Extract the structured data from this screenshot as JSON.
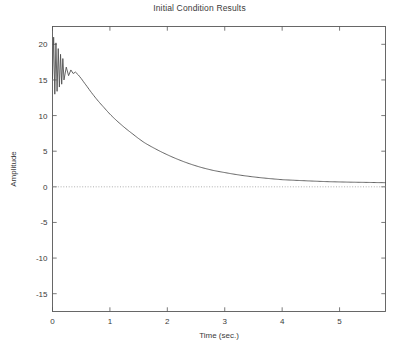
{
  "figure": {
    "title": "Initial Condition Results",
    "background": "#ffffff",
    "curve_color": "#4a4a4a",
    "axis_color": "#585858",
    "zero_line_color": "#9a9a9a"
  },
  "axes": {
    "x_title": "Time (sec.)",
    "y_title": "Amplitude",
    "x_ticks": [
      "0",
      "1",
      "2",
      "3",
      "4",
      "5"
    ],
    "y_ticks": [
      "20",
      "15",
      "10",
      "5",
      "0",
      "-5",
      "-10",
      "-15"
    ]
  },
  "chart_data": {
    "type": "line",
    "title": "Initial Condition Results",
    "xlabel": "Time (sec.)",
    "ylabel": "Amplitude",
    "xlim": [
      0,
      5.8
    ],
    "ylim": [
      -17.5,
      22.5
    ],
    "xticks": [
      0,
      1,
      2,
      3,
      4,
      5
    ],
    "yticks": [
      20,
      15,
      10,
      5,
      0,
      -5,
      -10,
      -15
    ],
    "grid": false,
    "legend": null,
    "annotations": [
      {
        "type": "hline",
        "y": 0,
        "style": "dotted",
        "label": "zero reference"
      }
    ],
    "series": [
      {
        "name": "initial condition response",
        "description": "Fast damped oscillation near t=0 decaying into a smooth exponential settling just above zero",
        "x": [
          0.0,
          0.02,
          0.04,
          0.06,
          0.08,
          0.1,
          0.12,
          0.14,
          0.16,
          0.18,
          0.2,
          0.24,
          0.28,
          0.32,
          0.36,
          0.4,
          0.45,
          0.5,
          0.6,
          0.7,
          0.8,
          0.9,
          1.0,
          1.2,
          1.4,
          1.6,
          1.8,
          2.0,
          2.2,
          2.4,
          2.6,
          2.8,
          3.0,
          3.3,
          3.6,
          4.0,
          4.4,
          4.8,
          5.2,
          5.8
        ],
        "y": [
          15.2,
          21.0,
          13.0,
          20.2,
          13.4,
          19.4,
          14.0,
          18.6,
          14.4,
          18.0,
          15.0,
          16.8,
          15.6,
          16.4,
          15.9,
          16.1,
          15.7,
          15.2,
          14.1,
          13.0,
          12.0,
          11.1,
          10.2,
          8.7,
          7.4,
          6.2,
          5.3,
          4.5,
          3.8,
          3.2,
          2.7,
          2.3,
          2.0,
          1.6,
          1.3,
          1.0,
          0.85,
          0.72,
          0.65,
          0.58
        ]
      }
    ]
  }
}
